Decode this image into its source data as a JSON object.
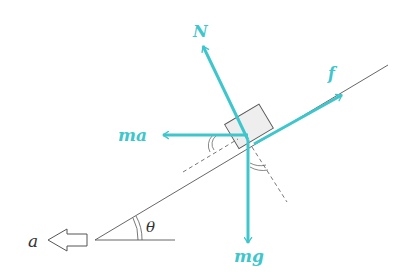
{
  "diagram": {
    "colors": {
      "force": "#3ec6cc",
      "line": "#555555",
      "block_fill": "#eeeeee",
      "label_dark": "#333333"
    },
    "labels": {
      "normal": "N",
      "friction": "f",
      "pseudo": "ma",
      "weight": "mg",
      "angle": "θ",
      "acceleration": "a"
    },
    "forces": [
      {
        "name": "N",
        "direction": "perpendicular to incline, outward"
      },
      {
        "name": "f",
        "direction": "up along incline"
      },
      {
        "name": "ma",
        "direction": "horizontal, left"
      },
      {
        "name": "mg",
        "direction": "vertical, down"
      }
    ]
  }
}
